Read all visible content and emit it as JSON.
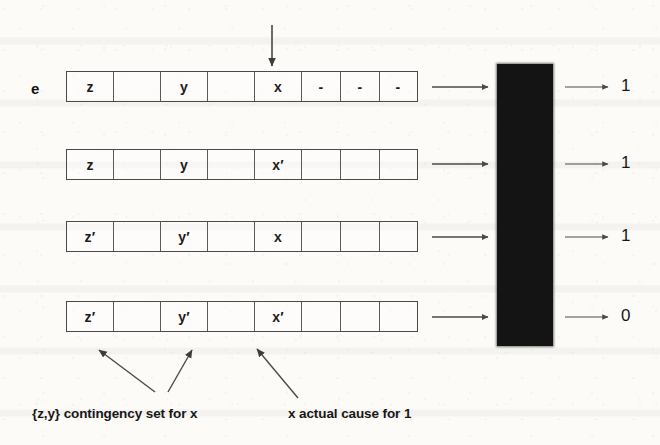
{
  "figure": {
    "left_label": "e",
    "rows": [
      {
        "name": "row-1",
        "cells": [
          "z",
          "",
          "y",
          "",
          "x",
          "-",
          "-",
          "-"
        ],
        "output": "1"
      },
      {
        "name": "row-2",
        "cells": [
          "z",
          "",
          "y",
          "",
          "x′",
          "",
          "",
          ""
        ],
        "output": "1"
      },
      {
        "name": "row-3",
        "cells": [
          "z′",
          "",
          "y′",
          "",
          "x",
          "",
          "",
          ""
        ],
        "output": "1"
      },
      {
        "name": "row-4",
        "cells": [
          "z′",
          "",
          "y′",
          "",
          "x′",
          "",
          "",
          ""
        ],
        "output": "0"
      }
    ],
    "captions": {
      "contingency": "{z,y} contingency set for x",
      "actual_cause": "x  actual cause for 1"
    },
    "colors": {
      "black_box": "#141414",
      "cell_border": "#4a4a48",
      "text": "#171717",
      "paper": "#fcfbf8"
    }
  }
}
